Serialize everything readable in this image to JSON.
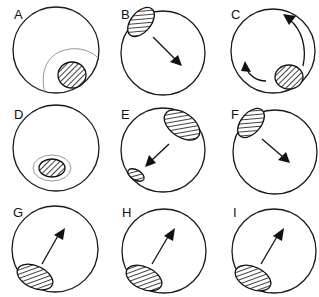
{
  "figure": {
    "colors": {
      "stroke": "#111111",
      "faint": "#8a8a8a",
      "background": "#ffffff"
    },
    "panels": [
      {
        "label": "A",
        "content": "hatched ellipse in lower-right inside a faint larger arc"
      },
      {
        "label": "B",
        "content": "hatched ellipse at upper-left edge with arrow pointing down-right"
      },
      {
        "label": "C",
        "content": "hatched ellipse at lower-right with curved arrows along the rim"
      },
      {
        "label": "D",
        "content": "hatched ellipse at bottom center surrounded by a faint ring"
      },
      {
        "label": "E",
        "content": "large hatched ellipse at upper-right, arrow pointing down-left to small hatched ellipse"
      },
      {
        "label": "F",
        "content": "hatched ellipse at upper-left edge with arrow pointing down-right"
      },
      {
        "label": "G",
        "content": "hatched ellipse at lower-left with arrow pointing up-right"
      },
      {
        "label": "H",
        "content": "hatched ellipse at lower-left with arrow pointing up-right"
      },
      {
        "label": "I",
        "content": "hatched ellipse at lower-left with arrow pointing up-right"
      }
    ]
  }
}
